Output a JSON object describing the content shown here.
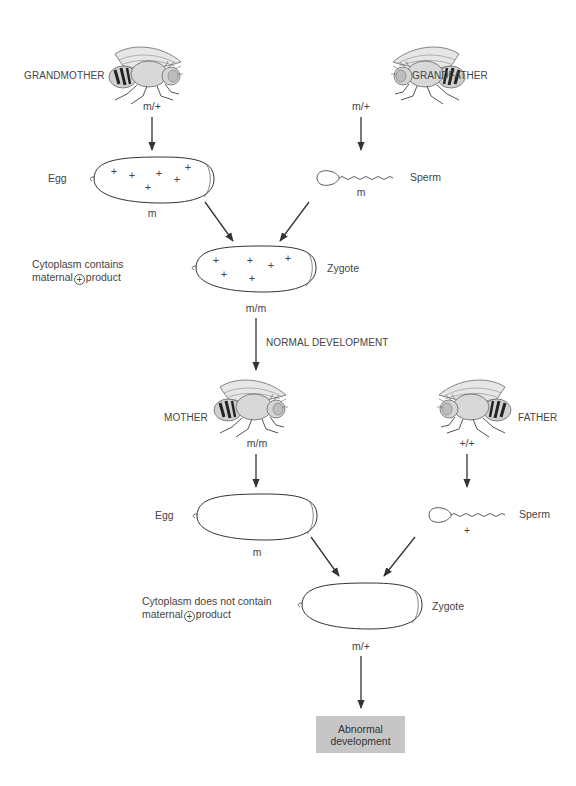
{
  "generation1": {
    "grandmother": {
      "label": "GRANDMOTHER",
      "genotype": "m/+"
    },
    "grandfather": {
      "label": "GRANDFATHER",
      "genotype": "m/+"
    },
    "egg": {
      "label": "Egg",
      "genotype": "m",
      "contents": "+"
    },
    "sperm": {
      "label": "Sperm",
      "genotype": "m"
    },
    "zygote": {
      "label": "Zygote",
      "genotype": "m/m",
      "caption_line1": "Cytoplasm contains",
      "caption_line2_pre": "maternal",
      "caption_symbol": "+",
      "caption_line2_post": "product"
    }
  },
  "transition": {
    "label": "NORMAL DEVELOPMENT"
  },
  "generation2": {
    "mother": {
      "label": "MOTHER",
      "genotype": "m/m"
    },
    "father": {
      "label": "FATHER",
      "genotype": "+/+"
    },
    "egg": {
      "label": "Egg",
      "genotype": "m"
    },
    "sperm": {
      "label": "Sperm",
      "genotype": "+"
    },
    "zygote": {
      "label": "Zygote",
      "genotype": "m/+",
      "caption_line1": "Cytoplasm does not contain",
      "caption_line2_pre": "maternal",
      "caption_symbol": "+",
      "caption_line2_post": "product"
    }
  },
  "outcome": {
    "line1": "Abnormal",
    "line2": "development"
  },
  "colors": {
    "line": "#3a3a3a",
    "outcome_box": "#c6c6c6",
    "fly_body": "#d8d8d8",
    "fly_stripes": "#222222"
  }
}
